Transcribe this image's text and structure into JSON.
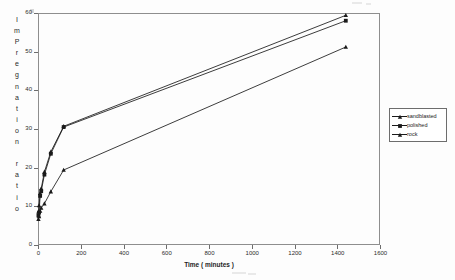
{
  "chart_data": {
    "type": "line",
    "title": "",
    "xlabel": "Time ( minutes )",
    "ylabel": "ImPregnation ratio",
    "ylabel_chars": [
      "I",
      "m",
      "P",
      "r",
      "e",
      "g",
      "n",
      "a",
      "t",
      "i",
      "o",
      "n",
      "",
      "r",
      "a",
      "t",
      "i",
      "o"
    ],
    "xlim": [
      0,
      1600
    ],
    "ylim": [
      0,
      60
    ],
    "xticks": [
      0,
      200,
      400,
      600,
      800,
      1000,
      1200,
      1400,
      1600
    ],
    "xtick_labels": [
      "0",
      "200",
      "400",
      "600",
      "800",
      "1000",
      "1200",
      "1400",
      "1600"
    ],
    "yticks": [
      0,
      10,
      20,
      30,
      40,
      50,
      60
    ],
    "ytick_labels": [
      "0",
      "10",
      "20",
      "30",
      "40",
      "50",
      "60"
    ],
    "grid": false,
    "legend_position": "right-outside",
    "series": [
      {
        "name": "sandblasted",
        "marker": "triangle",
        "color": "#1a1a1a",
        "points": [
          {
            "x": 2,
            "y": 8.6
          },
          {
            "x": 5,
            "y": 10.2
          },
          {
            "x": 10,
            "y": 13.4
          },
          {
            "x": 15,
            "y": 14.6
          },
          {
            "x": 30,
            "y": 18.9
          },
          {
            "x": 60,
            "y": 24.1
          },
          {
            "x": 120,
            "y": 30.7
          },
          {
            "x": 1440,
            "y": 59.4
          }
        ]
      },
      {
        "name": "polished",
        "marker": "square",
        "color": "#1a1a1a",
        "points": [
          {
            "x": 2,
            "y": 7.6
          },
          {
            "x": 5,
            "y": 8.4
          },
          {
            "x": 10,
            "y": 12.7
          },
          {
            "x": 15,
            "y": 13.9
          },
          {
            "x": 30,
            "y": 18.2
          },
          {
            "x": 60,
            "y": 23.6
          },
          {
            "x": 120,
            "y": 30.5
          },
          {
            "x": 1440,
            "y": 58.0
          }
        ]
      },
      {
        "name": "rock",
        "marker": "triangle",
        "color": "#1a1a1a",
        "points": [
          {
            "x": 2,
            "y": 6.7
          },
          {
            "x": 5,
            "y": 7.4
          },
          {
            "x": 10,
            "y": 8.8
          },
          {
            "x": 15,
            "y": 9.6
          },
          {
            "x": 30,
            "y": 10.7
          },
          {
            "x": 60,
            "y": 13.8
          },
          {
            "x": 120,
            "y": 19.4
          },
          {
            "x": 1440,
            "y": 51.2
          }
        ]
      }
    ]
  },
  "legend": {
    "items": [
      {
        "label": "sandblasted"
      },
      {
        "label": "polished"
      },
      {
        "label": "rock"
      }
    ]
  }
}
